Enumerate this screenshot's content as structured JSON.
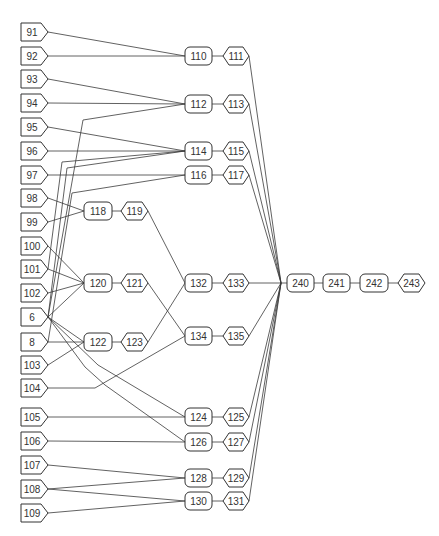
{
  "nodes": [
    {
      "id": "91",
      "label": "91",
      "shape": "input",
      "x": 21,
      "y": 32,
      "w": 27
    },
    {
      "id": "92",
      "label": "92",
      "shape": "input",
      "x": 21,
      "y": 56,
      "w": 27
    },
    {
      "id": "93",
      "label": "93",
      "shape": "input",
      "x": 21,
      "y": 79,
      "w": 27
    },
    {
      "id": "94",
      "label": "94",
      "shape": "input",
      "x": 21,
      "y": 103,
      "w": 27
    },
    {
      "id": "95",
      "label": "95",
      "shape": "input",
      "x": 21,
      "y": 127,
      "w": 27
    },
    {
      "id": "96",
      "label": "96",
      "shape": "input",
      "x": 21,
      "y": 151,
      "w": 27
    },
    {
      "id": "97",
      "label": "97",
      "shape": "input",
      "x": 21,
      "y": 175,
      "w": 27
    },
    {
      "id": "98",
      "label": "98",
      "shape": "input",
      "x": 21,
      "y": 198,
      "w": 27
    },
    {
      "id": "99",
      "label": "99",
      "shape": "input",
      "x": 21,
      "y": 222,
      "w": 27
    },
    {
      "id": "100",
      "label": "100",
      "shape": "input",
      "x": 21,
      "y": 246,
      "w": 27
    },
    {
      "id": "101",
      "label": "101",
      "shape": "input",
      "x": 21,
      "y": 269,
      "w": 27
    },
    {
      "id": "102",
      "label": "102",
      "shape": "input",
      "x": 21,
      "y": 293,
      "w": 27
    },
    {
      "id": "6",
      "label": "6",
      "shape": "input",
      "x": 21,
      "y": 317,
      "w": 27
    },
    {
      "id": "8",
      "label": "8",
      "shape": "input",
      "x": 21,
      "y": 342,
      "w": 27
    },
    {
      "id": "103",
      "label": "103",
      "shape": "input",
      "x": 21,
      "y": 365,
      "w": 27
    },
    {
      "id": "104",
      "label": "104",
      "shape": "input",
      "x": 21,
      "y": 388,
      "w": 27
    },
    {
      "id": "105",
      "label": "105",
      "shape": "input",
      "x": 21,
      "y": 417,
      "w": 27
    },
    {
      "id": "106",
      "label": "106",
      "shape": "input",
      "x": 21,
      "y": 441,
      "w": 27
    },
    {
      "id": "107",
      "label": "107",
      "shape": "input",
      "x": 21,
      "y": 465,
      "w": 27
    },
    {
      "id": "108",
      "label": "108",
      "shape": "input",
      "x": 21,
      "y": 489,
      "w": 27
    },
    {
      "id": "109",
      "label": "109",
      "shape": "input",
      "x": 21,
      "y": 513,
      "w": 27
    },
    {
      "id": "118",
      "label": "118",
      "shape": "rounded",
      "x": 84,
      "y": 211,
      "w": 28
    },
    {
      "id": "119",
      "label": "119",
      "shape": "hex",
      "x": 121,
      "y": 211,
      "w": 27
    },
    {
      "id": "120",
      "label": "120",
      "shape": "rounded",
      "x": 84,
      "y": 283,
      "w": 28
    },
    {
      "id": "121",
      "label": "121",
      "shape": "hex",
      "x": 121,
      "y": 283,
      "w": 27
    },
    {
      "id": "122",
      "label": "122",
      "shape": "rounded",
      "x": 84,
      "y": 342,
      "w": 28
    },
    {
      "id": "123",
      "label": "123",
      "shape": "hex",
      "x": 121,
      "y": 342,
      "w": 27
    },
    {
      "id": "110",
      "label": "110",
      "shape": "rounded",
      "x": 185,
      "y": 56,
      "w": 27
    },
    {
      "id": "111",
      "label": "111",
      "shape": "hex",
      "x": 223,
      "y": 56,
      "w": 26
    },
    {
      "id": "112",
      "label": "112",
      "shape": "rounded",
      "x": 185,
      "y": 104,
      "w": 27
    },
    {
      "id": "113",
      "label": "113",
      "shape": "hex",
      "x": 223,
      "y": 104,
      "w": 26
    },
    {
      "id": "114",
      "label": "114",
      "shape": "rounded",
      "x": 185,
      "y": 151,
      "w": 27
    },
    {
      "id": "115",
      "label": "115",
      "shape": "hex",
      "x": 223,
      "y": 151,
      "w": 26
    },
    {
      "id": "116",
      "label": "116",
      "shape": "rounded",
      "x": 185,
      "y": 175,
      "w": 27
    },
    {
      "id": "117",
      "label": "117",
      "shape": "hex",
      "x": 223,
      "y": 175,
      "w": 26
    },
    {
      "id": "132",
      "label": "132",
      "shape": "rounded",
      "x": 185,
      "y": 283,
      "w": 27
    },
    {
      "id": "133",
      "label": "133",
      "shape": "hex",
      "x": 223,
      "y": 283,
      "w": 26
    },
    {
      "id": "134",
      "label": "134",
      "shape": "rounded",
      "x": 185,
      "y": 336,
      "w": 27
    },
    {
      "id": "135",
      "label": "135",
      "shape": "hex",
      "x": 223,
      "y": 336,
      "w": 26
    },
    {
      "id": "124",
      "label": "124",
      "shape": "rounded",
      "x": 185,
      "y": 417,
      "w": 27
    },
    {
      "id": "125",
      "label": "125",
      "shape": "hex",
      "x": 223,
      "y": 417,
      "w": 26
    },
    {
      "id": "126",
      "label": "126",
      "shape": "rounded",
      "x": 185,
      "y": 442,
      "w": 27
    },
    {
      "id": "127",
      "label": "127",
      "shape": "hex",
      "x": 223,
      "y": 442,
      "w": 26
    },
    {
      "id": "128",
      "label": "128",
      "shape": "rounded",
      "x": 185,
      "y": 478,
      "w": 27
    },
    {
      "id": "129",
      "label": "129",
      "shape": "hex",
      "x": 223,
      "y": 478,
      "w": 26
    },
    {
      "id": "130",
      "label": "130",
      "shape": "rounded",
      "x": 185,
      "y": 501,
      "w": 27
    },
    {
      "id": "131",
      "label": "131",
      "shape": "hex",
      "x": 223,
      "y": 501,
      "w": 26
    },
    {
      "id": "J",
      "label": "",
      "shape": "junction",
      "x": 281,
      "y": 283,
      "w": 0
    },
    {
      "id": "240",
      "label": "240",
      "shape": "rounded",
      "x": 287,
      "y": 283,
      "w": 27
    },
    {
      "id": "241",
      "label": "241",
      "shape": "rounded",
      "x": 323,
      "y": 283,
      "w": 27
    },
    {
      "id": "242",
      "label": "242",
      "shape": "rounded",
      "x": 360,
      "y": 283,
      "w": 28
    },
    {
      "id": "243",
      "label": "243",
      "shape": "hex",
      "x": 398,
      "y": 283,
      "w": 27
    }
  ],
  "edges": [
    {
      "from": "91",
      "to": "110"
    },
    {
      "from": "92",
      "to": "110"
    },
    {
      "from": "93",
      "to": "112"
    },
    {
      "from": "94",
      "to": "112"
    },
    {
      "from": "95",
      "to": "114"
    },
    {
      "from": "96",
      "to": "114"
    },
    {
      "from": "97",
      "to": "116"
    },
    {
      "from": "98",
      "to": "118"
    },
    {
      "from": "99",
      "to": "118"
    },
    {
      "from": "100",
      "to": "120"
    },
    {
      "from": "101",
      "to": "120"
    },
    {
      "from": "102",
      "to": "120"
    },
    {
      "from": "6",
      "to": "120"
    },
    {
      "from": "6",
      "to": "122"
    },
    {
      "from": "8",
      "to": "122"
    },
    {
      "from": "103",
      "to": "122"
    },
    {
      "from": "104",
      "to": "134",
      "via": [
        [
          95,
          388
        ]
      ]
    },
    {
      "from": "105",
      "to": "124"
    },
    {
      "from": "106",
      "to": "126"
    },
    {
      "from": "107",
      "to": "128"
    },
    {
      "from": "108",
      "to": "128"
    },
    {
      "from": "108",
      "to": "130"
    },
    {
      "from": "109",
      "to": "130"
    },
    {
      "from": "6",
      "to": "112",
      "via": [
        [
          83,
          120
        ]
      ]
    },
    {
      "from": "101",
      "to": "114",
      "via": [
        [
          62,
          162
        ]
      ]
    },
    {
      "from": "6",
      "to": "114",
      "via": [
        [
          67,
          168
        ]
      ]
    },
    {
      "from": "8",
      "to": "116",
      "via": [
        [
          72,
          193
        ]
      ]
    },
    {
      "from": "6",
      "to": "124",
      "via": [
        [
          98,
          365
        ]
      ]
    },
    {
      "from": "6",
      "to": "126",
      "via": [
        [
          85,
          367
        ],
        [
          105,
          385
        ]
      ]
    },
    {
      "from": "118",
      "to": "119"
    },
    {
      "from": "119",
      "to": "132"
    },
    {
      "from": "120",
      "to": "121"
    },
    {
      "from": "121",
      "to": "134"
    },
    {
      "from": "122",
      "to": "123"
    },
    {
      "from": "123",
      "to": "132"
    },
    {
      "from": "110",
      "to": "111"
    },
    {
      "from": "112",
      "to": "113"
    },
    {
      "from": "114",
      "to": "115"
    },
    {
      "from": "116",
      "to": "117"
    },
    {
      "from": "132",
      "to": "133"
    },
    {
      "from": "134",
      "to": "135"
    },
    {
      "from": "124",
      "to": "125"
    },
    {
      "from": "126",
      "to": "127"
    },
    {
      "from": "128",
      "to": "129"
    },
    {
      "from": "130",
      "to": "131"
    },
    {
      "from": "111",
      "to": "J"
    },
    {
      "from": "113",
      "to": "J"
    },
    {
      "from": "115",
      "to": "J"
    },
    {
      "from": "117",
      "to": "J"
    },
    {
      "from": "133",
      "to": "J"
    },
    {
      "from": "135",
      "to": "J"
    },
    {
      "from": "125",
      "to": "J"
    },
    {
      "from": "127",
      "to": "J"
    },
    {
      "from": "129",
      "to": "J"
    },
    {
      "from": "131",
      "to": "J"
    },
    {
      "from": "J",
      "to": "240"
    },
    {
      "from": "240",
      "to": "241"
    },
    {
      "from": "241",
      "to": "242"
    },
    {
      "from": "242",
      "to": "243"
    }
  ],
  "style": {
    "line_color": "#3a3a3a",
    "node_stroke": "#333333",
    "node_fill": "#ffffff",
    "text_color": "#333333",
    "background": "#ffffff"
  }
}
